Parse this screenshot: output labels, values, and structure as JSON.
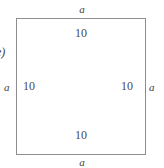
{
  "figure": {
    "part_label": "e)",
    "shape": "square",
    "outline_color": "#8d8d8d",
    "text_color": "#4a4a4a",
    "background_color": "#ffffff",
    "outer_labels": {
      "top": "a",
      "right": "a",
      "bottom": "a",
      "left": "a"
    },
    "inner_labels": {
      "top": "10",
      "right": "10",
      "bottom": "10",
      "left": "10"
    }
  }
}
